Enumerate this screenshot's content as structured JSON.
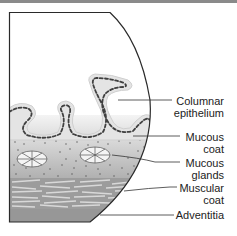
{
  "diagram": {
    "labels": [
      {
        "id": "columnar-epithelium",
        "line1": "Columnar",
        "line2": "epithelium"
      },
      {
        "id": "mucous-coat",
        "line1": "Mucous",
        "line2": "coat"
      },
      {
        "id": "mucous-glands",
        "line1": "Mucous",
        "line2": "glands"
      },
      {
        "id": "muscular-coat",
        "line1": "Muscular",
        "line2": "coat"
      },
      {
        "id": "adventitia",
        "line1": "Adventitia",
        "line2": ""
      }
    ],
    "colors": {
      "outline": "#2a2a2a",
      "epithelium_fill": "#e6e6e6",
      "epithelium_dash": "#444444",
      "mucosa_top": "#f2f2f2",
      "mucosa_bottom": "#a8a8a8",
      "muscle": "#8e8e8e",
      "adventitia": "#9a9a9a"
    }
  }
}
